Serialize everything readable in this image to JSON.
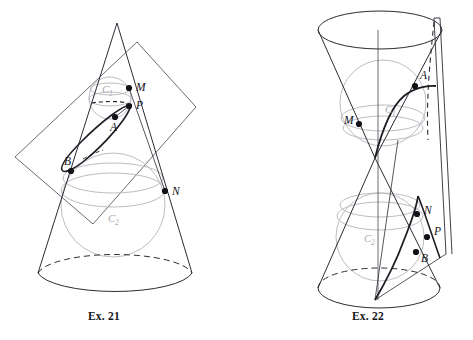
{
  "figure": {
    "title_visible": false,
    "background_color": "#ffffff",
    "ink_color": "#2b2b33",
    "sphere_color": "#b4b4bb",
    "label_color": "#131318",
    "gray_label_color": "#a9a9b0",
    "dot_color": "#111116"
  },
  "panels": [
    {
      "id": "ex21",
      "caption": "Ex. 21",
      "description": "Single cone cut by an oblique plane, with two inscribed Dandelin spheres tangent to the cone and to the cutting plane; the conic section is an ellipse.",
      "conic_type": "ellipse",
      "solid": "single-napped-cone",
      "cutting_plane": "parallelogram",
      "spheres": [
        {
          "name": "C1",
          "label": "C",
          "subscript": "1",
          "role": "upper-dandelin-sphere"
        },
        {
          "name": "C2",
          "label": "C",
          "subscript": "2",
          "role": "lower-dandelin-sphere"
        }
      ],
      "points": [
        {
          "label": "M",
          "role": "tangency-on-upper-circle",
          "x": 129,
          "y": 88
        },
        {
          "label": "P",
          "role": "point-on-conic",
          "x": 129,
          "y": 106
        },
        {
          "label": "A",
          "role": "tangency-with-upper-sphere",
          "x": 115,
          "y": 117
        },
        {
          "label": "B",
          "role": "tangency-with-lower-sphere",
          "x": 71,
          "y": 171
        },
        {
          "label": "N",
          "role": "tangency-on-lower-circle",
          "x": 165,
          "y": 191
        }
      ]
    },
    {
      "id": "ex22",
      "caption": "Ex. 22",
      "description": "Double-napped cone cut by a plane parallel to the axis, with one Dandelin sphere in each nappe; the conic section is a hyperbola with two branches.",
      "conic_type": "hyperbola",
      "solid": "double-napped-cone",
      "cutting_plane": "vertical-plane",
      "spheres": [
        {
          "name": "C1",
          "label": "C",
          "subscript": "1",
          "role": "upper-dandelin-sphere"
        },
        {
          "name": "C2",
          "label": "C",
          "subscript": "2",
          "role": "lower-dandelin-sphere"
        }
      ],
      "points": [
        {
          "label": "A",
          "role": "point-on-upper-branch",
          "x": 415,
          "y": 86
        },
        {
          "label": "M",
          "role": "tangency-on-upper-circle",
          "x": 359,
          "y": 124
        },
        {
          "label": "N",
          "role": "tangency-on-lower-circle",
          "x": 417,
          "y": 214
        },
        {
          "label": "P",
          "role": "point-on-lower-branch",
          "x": 427,
          "y": 237
        },
        {
          "label": "B",
          "role": "tangency-with-lower-sphere",
          "x": 416,
          "y": 252
        }
      ]
    }
  ]
}
